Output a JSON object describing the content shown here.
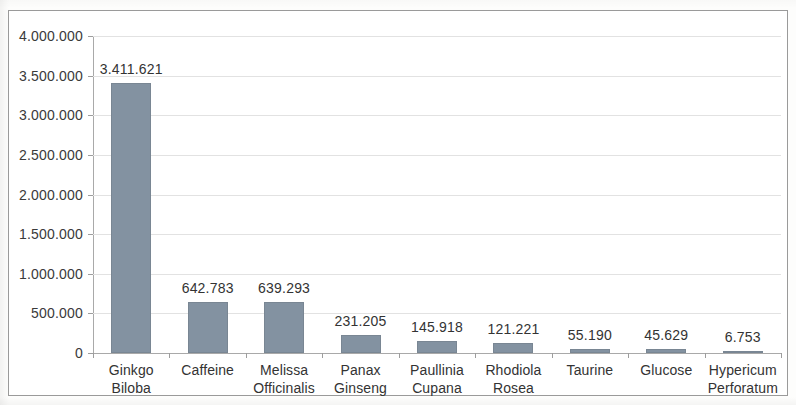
{
  "chart_data": {
    "type": "bar",
    "title": "",
    "subtitle": "",
    "xlabel": "",
    "ylabel": "",
    "categories": [
      "Ginkgo\nBiloba",
      "Caffeine",
      "Melissa\nOfficinalis",
      "Panax\nGinseng",
      "Paullinia\nCupana",
      "Rhodiola\nRosea",
      "Taurine",
      "Glucose",
      "Hypericum\nPerforatum"
    ],
    "values": [
      3411621,
      642783,
      639293,
      231205,
      145918,
      121221,
      55190,
      45629,
      6753
    ],
    "data_labels": [
      "3.411.621",
      "642.783",
      "639.293",
      "231.205",
      "145.918",
      "121.221",
      "55.190",
      "45.629",
      "6.753"
    ],
    "ylim": [
      0,
      4000000
    ],
    "ytick_values": [
      0,
      500000,
      1000000,
      1500000,
      2000000,
      2500000,
      3000000,
      3500000,
      4000000
    ],
    "ytick_labels": [
      "0",
      "500.000",
      "1.000.000",
      "1.500.000",
      "2.000.000",
      "2.500.000",
      "3.000.000",
      "3.500.000",
      "4.000.000"
    ],
    "grid": true,
    "legend": false,
    "legend_position": "none",
    "bar_color": "#8392a1",
    "gridline_color": "#e2e2e2",
    "axis_color": "#a9a9a9",
    "text_color": "#333333",
    "background_color": "#ffffff"
  }
}
